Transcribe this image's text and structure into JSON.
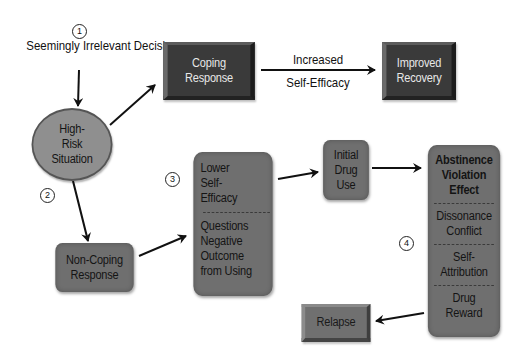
{
  "diagram": {
    "type": "flowchart",
    "title": "",
    "steps": [
      {
        "id": "step-1",
        "label": "1"
      },
      {
        "id": "step-2",
        "label": "2"
      },
      {
        "id": "step-3",
        "label": "3"
      },
      {
        "id": "step-4",
        "label": "4"
      }
    ],
    "nodes": {
      "sid": {
        "lines": [
          "Seemingly",
          "Irrelevant Decision"
        ]
      },
      "high_risk": {
        "lines": [
          "High-",
          "Risk",
          "Situation"
        ]
      },
      "coping": {
        "lines": [
          "Coping",
          "Response"
        ]
      },
      "improved": {
        "lines": [
          "Improved",
          "Recovery"
        ]
      },
      "non_coping": {
        "lines": [
          "Non-Coping",
          "Response"
        ]
      },
      "lower_se": {
        "sections": [
          {
            "lines": [
              "Lower",
              "Self-",
              "Efficacy"
            ]
          },
          {
            "lines": [
              "Questions",
              "Negative",
              "Outcome",
              "from Using"
            ]
          }
        ]
      },
      "initial_use": {
        "lines": [
          "Initial",
          "Drug",
          "Use"
        ]
      },
      "ave": {
        "sections": [
          {
            "lines": [
              "Abstinence",
              "Violation",
              "Effect"
            ],
            "bold": true
          },
          {
            "lines": [
              "Dissonance",
              "Conflict"
            ]
          },
          {
            "lines": [
              "Self-",
              "Attribution"
            ]
          },
          {
            "lines": [
              "Drug",
              "Reward"
            ]
          }
        ]
      },
      "relapse": {
        "lines": [
          "Relapse"
        ]
      }
    },
    "edge_labels": {
      "coping_to_improved": {
        "above": "Increased",
        "below": "Self-Efficacy"
      }
    },
    "edges": [
      {
        "from": "sid",
        "to": "high_risk"
      },
      {
        "from": "high_risk",
        "to": "coping"
      },
      {
        "from": "coping",
        "to": "improved"
      },
      {
        "from": "high_risk",
        "to": "non_coping"
      },
      {
        "from": "non_coping",
        "to": "lower_se"
      },
      {
        "from": "lower_se",
        "to": "initial_use"
      },
      {
        "from": "initial_use",
        "to": "ave"
      },
      {
        "from": "ave",
        "to": "relapse"
      }
    ],
    "colors": {
      "dark_box": "#3a3a3a",
      "grey_box": "#6f6f6f",
      "ellipse": "#8f8f8f",
      "arrow": "#111111",
      "background": "#ffffff"
    }
  }
}
